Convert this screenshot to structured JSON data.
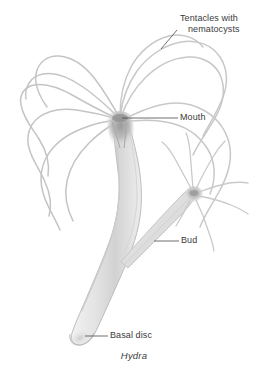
{
  "figure": {
    "caption": "Hydra",
    "organism": "hydra",
    "background_color": "#ffffff",
    "ink_color": "#9a9a9a",
    "text_color": "#3a3a3a",
    "labels": [
      {
        "id": "tentacles",
        "name": "tentacles-with-nematocysts",
        "line1": "Tentacles with",
        "line2": "nematocysts"
      },
      {
        "id": "mouth",
        "name": "mouth",
        "text": "Mouth"
      },
      {
        "id": "bud",
        "name": "bud",
        "text": "Bud"
      },
      {
        "id": "basal_disc",
        "name": "basal-disc",
        "text": "Basal disc"
      }
    ]
  }
}
